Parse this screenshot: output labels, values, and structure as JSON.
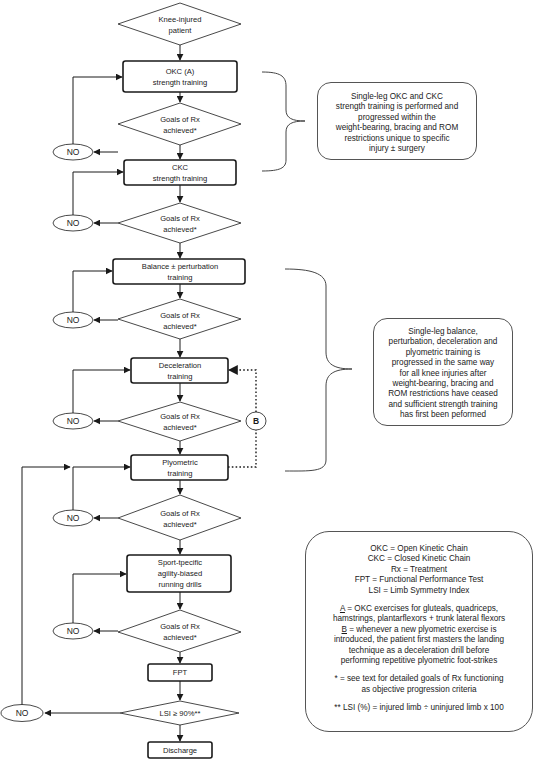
{
  "flowchart": {
    "start": {
      "lines": [
        "Knee-injured",
        "patient"
      ]
    },
    "steps": [
      {
        "id": "okc",
        "lines": [
          "OKC (A)",
          "strength training"
        ]
      },
      {
        "id": "ckc",
        "lines": [
          "CKC",
          "strength training"
        ]
      },
      {
        "id": "balance",
        "lines": [
          "Balance ± perturbation",
          "training"
        ]
      },
      {
        "id": "deceleration",
        "lines": [
          "Deceleration",
          "training"
        ]
      },
      {
        "id": "plyometric",
        "lines": [
          "Plyometric",
          "training"
        ]
      },
      {
        "id": "sport",
        "lines": [
          "Sport-tpecific",
          "agility-biased",
          "running drills"
        ]
      },
      {
        "id": "fpt",
        "lines": [
          "FPT"
        ]
      },
      {
        "id": "discharge",
        "lines": [
          "Discharge"
        ]
      }
    ],
    "decision_label": [
      "Goals of Rx",
      "achieved*"
    ],
    "final_decision": {
      "lines": [
        "LSI ≥ 90%**"
      ]
    },
    "no_label": "NO",
    "b_label": "B"
  },
  "notes": {
    "strength": [
      "Single-leg OKC and CKC",
      "strength training is performed and",
      "progressed within the",
      "weight-bearing, bracing and ROM",
      "restrictions unique to specific",
      "injury ± surgery"
    ],
    "neuromuscular": [
      "Single-leg balance,",
      "perturbation, deceleration and",
      "plyometric training is",
      "progressed in the same way",
      "for all knee injuries after",
      "weight-bearing, bracing and",
      "ROM restrictions have ceased",
      "and sufficient strength training",
      "has first been peformed"
    ],
    "legend": {
      "abbreviations": [
        "OKC = Open Kinetic Chain",
        "CKC = Closed Kinetic Chain",
        "Rx = Treatment",
        "FPT = Functional Performance Test",
        "LSI = Limb Symmetry Index"
      ],
      "a_key": "A",
      "a_text": [
        " = OKC exercises for gluteals, quadriceps,",
        "hamstrings, plantarflexors + trunk lateral flexors"
      ],
      "b_key": "B",
      "b_text": [
        " = whenever a new plyometric exercise is",
        "introduced, the patient first masters the landing",
        "technique as a deceleration drill before",
        "performing repetitive plyometric foot-strikes"
      ],
      "goals_note": [
        "* = see text for detailed goals of Rx functioning",
        "as objective progression criteria"
      ],
      "lsi_note": "** LSI (%) = injured limb ÷ uninjured limb x 100"
    }
  },
  "colors": {
    "stroke": "#1a1a1a",
    "text": "#1a1a1a",
    "bracket": "#444444",
    "background": "#ffffff"
  }
}
